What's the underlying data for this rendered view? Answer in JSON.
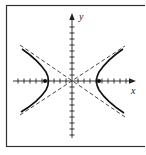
{
  "figure": {
    "type": "hyperbola",
    "axes": {
      "x_label": "x",
      "y_label": "y",
      "x_ticks_each_side": 9,
      "y_ticks_each_side": 9
    },
    "curve": {
      "vertices": [
        -4,
        4
      ],
      "foci": [
        -4.5,
        4.5
      ],
      "asymptote_slope": 0.65,
      "asymptote_style": "dashed"
    },
    "colors": {
      "curve": "#111111",
      "axes": "#222222",
      "asymptote": "#333333",
      "frame": "#333333",
      "background": "#ffffff"
    }
  }
}
